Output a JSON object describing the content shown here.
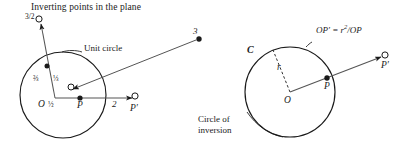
{
  "figure": {
    "title": "Inverting points in the plane",
    "width": 410,
    "height": 154,
    "background": "#ffffff",
    "ink": "#1a1a1a"
  },
  "left_diagram": {
    "name": "unit-circle-inversion",
    "circle_label": "Unit circle",
    "center_label": "O",
    "point_p_label": "P",
    "point_p_prime_label": "P′",
    "distance_two_label": "2",
    "distance_three_label": "3",
    "fraction_half": {
      "numerator": "1",
      "denominator": "2",
      "text": "½"
    },
    "fraction_third": {
      "numerator": "1",
      "denominator": "3",
      "text": "⅓"
    },
    "fraction_two_thirds": {
      "numerator": "2",
      "denominator": "3",
      "text": "⅔"
    },
    "fraction_three_halves": {
      "numerator": "3",
      "denominator": "2",
      "text": "3/2"
    },
    "points": [
      {
        "label": "O",
        "kind": "center",
        "filled": false
      },
      {
        "label": "½",
        "kind": "inside",
        "filled": true
      },
      {
        "label": "P",
        "kind": "inside",
        "filled": true
      },
      {
        "label": "2",
        "kind": "outside",
        "filled": false
      },
      {
        "label": "3",
        "kind": "outside",
        "filled": true
      },
      {
        "label": "⅓",
        "kind": "inside",
        "filled": false
      },
      {
        "label": "⅔",
        "kind": "inside",
        "filled": true
      },
      {
        "label": "3/2",
        "kind": "outside",
        "filled": false
      }
    ]
  },
  "right_diagram": {
    "name": "circle-of-inversion",
    "circle_label": "C",
    "center_label": "O",
    "radius_label": "r",
    "point_p_label": "P",
    "point_p_prime_label": "P′",
    "formula_prefix": "OP′ = r",
    "formula_exponent": "2",
    "formula_suffix": "/OP",
    "caption_line1": "Circle of",
    "caption_line2": "inversion"
  }
}
